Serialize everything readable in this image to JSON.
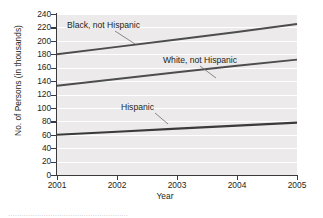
{
  "chart_data": {
    "type": "line",
    "title": "",
    "xlabel": "Year",
    "ylabel": "No. of Persons (in thousands)",
    "x": [
      2001,
      2002,
      2003,
      2004,
      2005
    ],
    "xtick_labels": [
      "2001",
      "2002",
      "2003",
      "2004",
      "2005"
    ],
    "xlim": [
      2001,
      2005
    ],
    "ylim": [
      0,
      240
    ],
    "ytick_labels": [
      "0",
      "20",
      "40",
      "60",
      "80",
      "100",
      "120",
      "140",
      "160",
      "180",
      "200",
      "220",
      "240"
    ],
    "ytick_values": [
      0,
      20,
      40,
      60,
      80,
      100,
      120,
      140,
      160,
      180,
      200,
      220,
      240
    ],
    "grid": "horizontal-white-on-gray",
    "legend": "inline-annotations-with-leader-lines",
    "series": [
      {
        "name": "Black, not Hispanic",
        "values": [
          180,
          191,
          202,
          213,
          225
        ],
        "color": "#4d4d4d"
      },
      {
        "name": "White, not Hispanic",
        "values": [
          133,
          143,
          153,
          163,
          172
        ],
        "color": "#4d4d4d"
      },
      {
        "name": "Hispanic",
        "values": [
          60,
          64.5,
          69,
          73.5,
          78
        ],
        "color": "#3a3a3a"
      }
    ],
    "annotations": [
      {
        "text": "Black, not Hispanic",
        "points_to_series": "Black, not Hispanic"
      },
      {
        "text": "White, not Hispanic",
        "points_to_series": "White, not Hispanic"
      },
      {
        "text": "Hispanic",
        "points_to_series": "Hispanic"
      }
    ],
    "plot_background": "#eceaea",
    "gridline_color": "#ffffff",
    "axis_color": "#3a3a3a"
  },
  "caption_sliver": "......................................................"
}
